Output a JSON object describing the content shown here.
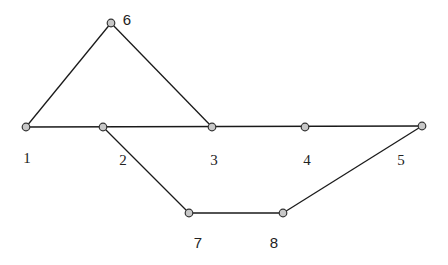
{
  "diagram": {
    "type": "graph",
    "colors": {
      "edge": "#1a1a1a",
      "node_fill": "#c8c8c8",
      "node_stroke": "#333333",
      "background": "#ffffff"
    },
    "nodes": [
      {
        "id": "1",
        "label": "1",
        "x": 26,
        "y": 127,
        "lx": 27,
        "ly": 163,
        "font": "serif"
      },
      {
        "id": "2",
        "label": "2",
        "x": 103,
        "y": 127,
        "lx": 123,
        "ly": 165,
        "font": "serif"
      },
      {
        "id": "3",
        "label": "3",
        "x": 212,
        "y": 127,
        "lx": 214,
        "ly": 165,
        "font": "serif"
      },
      {
        "id": "4",
        "label": "4",
        "x": 305,
        "y": 127,
        "lx": 307,
        "ly": 165,
        "font": "serif"
      },
      {
        "id": "5",
        "label": "5",
        "x": 422,
        "y": 126,
        "lx": 401,
        "ly": 165,
        "font": "serif"
      },
      {
        "id": "6",
        "label": "6",
        "x": 111,
        "y": 23,
        "lx": 127,
        "ly": 25,
        "font": "sans"
      },
      {
        "id": "7",
        "label": "7",
        "x": 189,
        "y": 213,
        "lx": 198,
        "ly": 248,
        "font": "sans"
      },
      {
        "id": "8",
        "label": "8",
        "x": 283,
        "y": 213,
        "lx": 274,
        "ly": 248,
        "font": "sans"
      }
    ],
    "edges": [
      {
        "from": "1",
        "to": "6"
      },
      {
        "from": "6",
        "to": "3"
      },
      {
        "from": "1",
        "to": "5"
      },
      {
        "from": "2",
        "to": "7"
      },
      {
        "from": "7",
        "to": "8"
      },
      {
        "from": "8",
        "to": "5"
      }
    ]
  }
}
